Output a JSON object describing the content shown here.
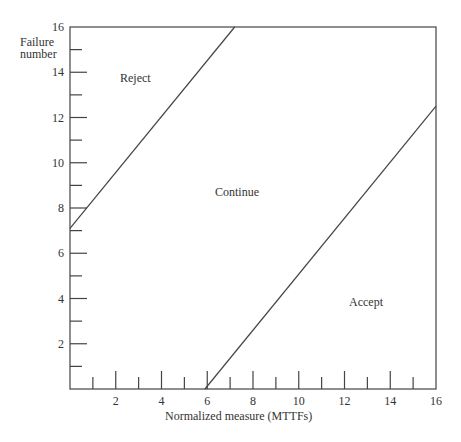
{
  "chart_data": {
    "type": "line",
    "title": "",
    "xlabel": "Normalized measure (MTTFs)",
    "ylabel": "Failure number",
    "xlim": [
      0,
      16
    ],
    "ylim": [
      0,
      16
    ],
    "x_ticks_major": [
      2,
      4,
      6,
      8,
      10,
      12,
      14,
      16
    ],
    "y_ticks_major": [
      2,
      4,
      6,
      8,
      10,
      12,
      14,
      16
    ],
    "grid": false,
    "series": [
      {
        "name": "Reject boundary",
        "points": [
          [
            0,
            7.1
          ],
          [
            7.2,
            16
          ]
        ]
      },
      {
        "name": "Accept boundary",
        "points": [
          [
            5.9,
            0
          ],
          [
            16,
            12.5
          ]
        ]
      }
    ],
    "annotations": [
      {
        "text": "Reject",
        "x": 2.5,
        "y": 14
      },
      {
        "text": "Continue",
        "x": 8,
        "y": 9
      },
      {
        "text": "Accept",
        "x": 12.5,
        "y": 4
      }
    ]
  },
  "labels": {
    "ylabel_line1": "Failure",
    "ylabel_line2": "number",
    "xlabel": "Normalized measure (MTTFs)",
    "reject": "Reject",
    "continue": "Continue",
    "accept": "Accept"
  }
}
